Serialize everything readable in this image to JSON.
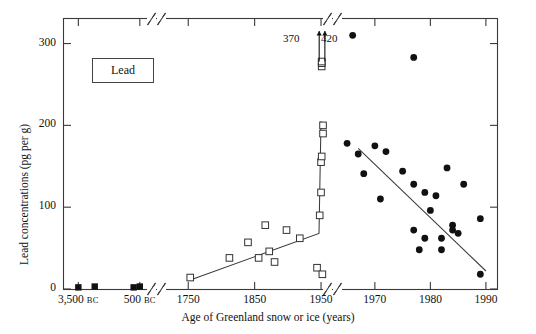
{
  "figure": {
    "legend_label": "Lead",
    "y_axis_title": "Lead concentrations (pg per g)",
    "x_axis_title": "Age of Greenland snow or ice (years)",
    "annotation_left": "370",
    "annotation_right": "420"
  },
  "chart_data": {
    "type": "scatter",
    "title": "Lead",
    "xlabel": "Age of Greenland snow or ice (years)",
    "ylabel": "Lead concentrations (pg per g)",
    "ylim": [
      0,
      330
    ],
    "yticks": [
      0,
      100,
      200,
      300
    ],
    "ytick_labels": [
      "0",
      "100",
      "200",
      "300"
    ],
    "grid": false,
    "legend": "none",
    "broken_axis": true,
    "x_segments": [
      {
        "name": "ancient",
        "ticks": [
          -3500,
          -500
        ],
        "tick_labels": [
          "3,500 BC",
          "500 BC"
        ],
        "range": [
          -4200,
          -100
        ]
      },
      {
        "name": "historic",
        "ticks": [
          1750,
          1850,
          1950
        ],
        "tick_labels": [
          "1750",
          "1850",
          "1950"
        ],
        "range": [
          1715,
          1962
        ]
      },
      {
        "name": "modern",
        "ticks": [
          1970,
          1980,
          1990
        ],
        "tick_labels": [
          "1970",
          "1980",
          "1990"
        ],
        "range": [
          1963,
          1992
        ]
      }
    ],
    "series": [
      {
        "name": "Ancient ice (filled squares)",
        "marker": "filled-square",
        "points": [
          {
            "x": -3500,
            "y": 2
          },
          {
            "x": -2700,
            "y": 3
          },
          {
            "x": -800,
            "y": 2
          },
          {
            "x": -500,
            "y": 3
          }
        ]
      },
      {
        "name": "Historic snow and ice (open squares)",
        "marker": "open-square",
        "points": [
          {
            "x": 1753,
            "y": 14
          },
          {
            "x": 1812,
            "y": 38
          },
          {
            "x": 1840,
            "y": 57
          },
          {
            "x": 1856,
            "y": 38
          },
          {
            "x": 1866,
            "y": 78
          },
          {
            "x": 1872,
            "y": 46
          },
          {
            "x": 1880,
            "y": 33
          },
          {
            "x": 1898,
            "y": 72
          },
          {
            "x": 1918,
            "y": 62
          },
          {
            "x": 1944,
            "y": 26
          },
          {
            "x": 1948,
            "y": 90
          },
          {
            "x": 1950,
            "y": 118
          },
          {
            "x": 1950,
            "y": 155
          },
          {
            "x": 1951,
            "y": 162
          },
          {
            "x": 1953,
            "y": 200
          },
          {
            "x": 1953,
            "y": 190
          },
          {
            "x": 1952,
            "y": 18
          },
          {
            "x": 1951,
            "y": 272
          },
          {
            "x": 1951,
            "y": 276
          },
          {
            "x": 1951,
            "y": 278
          }
        ]
      },
      {
        "name": "Modern snow (filled circles)",
        "marker": "filled-circle",
        "points": [
          {
            "x": 1966,
            "y": 310
          },
          {
            "x": 1965,
            "y": 178
          },
          {
            "x": 1967,
            "y": 165
          },
          {
            "x": 1968,
            "y": 141
          },
          {
            "x": 1970,
            "y": 175
          },
          {
            "x": 1971,
            "y": 110
          },
          {
            "x": 1972,
            "y": 168
          },
          {
            "x": 1975,
            "y": 144
          },
          {
            "x": 1977,
            "y": 128
          },
          {
            "x": 1977,
            "y": 72
          },
          {
            "x": 1977,
            "y": 283
          },
          {
            "x": 1978,
            "y": 48
          },
          {
            "x": 1979,
            "y": 118
          },
          {
            "x": 1979,
            "y": 62
          },
          {
            "x": 1980,
            "y": 96
          },
          {
            "x": 1981,
            "y": 114
          },
          {
            "x": 1982,
            "y": 62
          },
          {
            "x": 1982,
            "y": 48
          },
          {
            "x": 1983,
            "y": 148
          },
          {
            "x": 1984,
            "y": 78
          },
          {
            "x": 1984,
            "y": 72
          },
          {
            "x": 1985,
            "y": 68
          },
          {
            "x": 1986,
            "y": 128
          },
          {
            "x": 1989,
            "y": 86
          },
          {
            "x": 1989,
            "y": 18
          }
        ]
      },
      {
        "name": "Off-scale samples (arrows)",
        "marker": "arrow-up",
        "points": [
          {
            "x": 1951,
            "y": 370,
            "label": "370"
          },
          {
            "x": 1952,
            "y": 420,
            "label": "420"
          }
        ]
      }
    ],
    "trend_lines": [
      {
        "name": "historic-rise",
        "points": [
          [
            1750,
            10
          ],
          [
            1947,
            68
          ],
          [
            1950,
            205
          ]
        ]
      },
      {
        "name": "modern-decline",
        "points": [
          [
            1967,
            172
          ],
          [
            1990,
            22
          ]
        ]
      }
    ]
  }
}
